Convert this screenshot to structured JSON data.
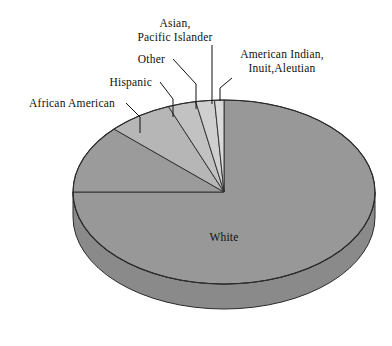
{
  "chart_data": {
    "type": "pie",
    "title": "",
    "subtitle": "",
    "xlabel": "",
    "ylabel": "",
    "legend_position": "none",
    "grid": false,
    "style": "3d-exploded-none",
    "center": {
      "x": 224,
      "y": 192
    },
    "radius": {
      "rx": 151,
      "ry": 92
    },
    "depth_px": 25,
    "start_angle_deg": -90,
    "direction": "counterclockwise",
    "categories": [
      "White",
      "African American",
      "Hispanic",
      "Other",
      "Asian, Pacific Islander",
      "American Indian, Inuit,Aleutian"
    ],
    "values": [
      75.0,
      12.0,
      7.0,
      3.0,
      2.0,
      1.0
    ],
    "slices": [
      {
        "name": "White",
        "label": "White",
        "value": 75.0,
        "color": "#989898",
        "side_color": "#8a8a8a",
        "label_placement": "inside",
        "label_x": 224,
        "label_y": 241
      },
      {
        "name": "African American",
        "label": "African American",
        "value": 12.0,
        "color": "#9b9b9b",
        "side_color": "#8d8d8d",
        "label_placement": "leader",
        "label_x": 115,
        "label_y": 107,
        "label_anchor": "end",
        "leader_elbow_x": 126,
        "leader_elbow_y": 103,
        "leader_tip_x": 140,
        "leader_tip_y": 133,
        "leader_tick_top_y": 117
      },
      {
        "name": "Hispanic",
        "label": "Hispanic",
        "value": 7.0,
        "color": "#b6b6b6",
        "side_color": "#a6a6a6",
        "label_placement": "leader",
        "label_x": 152,
        "label_y": 86,
        "label_anchor": "end",
        "leader_elbow_x": 160,
        "leader_elbow_y": 82,
        "leader_tip_x": 173,
        "leader_tip_y": 117,
        "leader_tick_top_y": 99
      },
      {
        "name": "Other",
        "label": "Other",
        "value": 3.0,
        "color": "#c2c2c2",
        "side_color": "#b2b2b2",
        "label_placement": "leader",
        "label_x": 165,
        "label_y": 63,
        "label_anchor": "end",
        "leader_elbow_x": 173,
        "leader_elbow_y": 59,
        "leader_tip_x": 196,
        "leader_tip_y": 109,
        "leader_tick_top_y": 84
      },
      {
        "name": "Asian, Pacific Islander",
        "label_line1": "Asian,",
        "label_line2": "Pacific Islander",
        "value": 2.0,
        "color": "#cfcfcf",
        "side_color": "#bdbdbd",
        "label_placement": "leader",
        "label_x": 175,
        "label_y_line1": 27,
        "label_y_line2": 41,
        "label_anchor": "middle",
        "leader_elbow_x": 212,
        "leader_elbow_y": 45,
        "leader_tip_x": 212,
        "leader_tip_y": 104,
        "leader_tick_top_y": 45
      },
      {
        "name": "American Indian, Inuit,Aleutian",
        "label_line1": "American Indian,",
        "label_line2": "Inuit,Aleutian",
        "value": 1.0,
        "color": "#dadada",
        "side_color": "#c8c8c8",
        "label_placement": "leader",
        "label_x": 282,
        "label_y_line1": 58,
        "label_y_line2": 72,
        "label_anchor": "middle",
        "leader_elbow_x": 232,
        "leader_elbow_y": 78,
        "leader_tip_x": 220,
        "leader_tip_y": 101,
        "leader_tick_top_y": 88
      }
    ]
  },
  "colors": {
    "background": "#ffffff",
    "outline": "#2a2a2a",
    "text": "#111111",
    "leader": "#111111"
  }
}
